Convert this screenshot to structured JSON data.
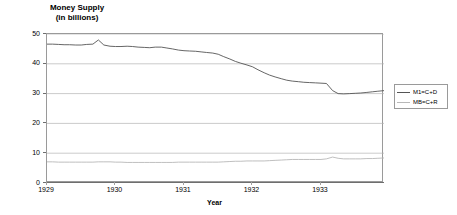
{
  "chart_data": {
    "type": "line",
    "title": "Money Supply",
    "subtitle": "(in billions)",
    "xlabel": "Year",
    "ylabel": "",
    "xlim": [
      1929.0,
      1933.92
    ],
    "ylim": [
      0,
      50
    ],
    "y_ticks": [
      0,
      10,
      20,
      30,
      40,
      50
    ],
    "x_ticks": [
      1929,
      1930,
      1931,
      1932,
      1933
    ],
    "x_tick_labels": [
      "1929",
      "1930",
      "1931",
      "1932",
      "1933"
    ],
    "grid": "horizontal",
    "legend_position": "right-outside",
    "series": [
      {
        "name": "M1=C+D",
        "color": "#555555",
        "x": [
          1929.0,
          1929.08,
          1929.17,
          1929.25,
          1929.33,
          1929.42,
          1929.5,
          1929.58,
          1929.67,
          1929.75,
          1929.83,
          1929.92,
          1930.0,
          1930.08,
          1930.17,
          1930.25,
          1930.33,
          1930.42,
          1930.5,
          1930.58,
          1930.67,
          1930.75,
          1930.83,
          1930.92,
          1931.0,
          1931.08,
          1931.17,
          1931.25,
          1931.33,
          1931.42,
          1931.5,
          1931.58,
          1931.67,
          1931.75,
          1931.83,
          1931.92,
          1932.0,
          1932.08,
          1932.17,
          1932.25,
          1932.33,
          1932.42,
          1932.5,
          1932.58,
          1932.67,
          1932.75,
          1932.83,
          1932.92,
          1933.0,
          1933.08,
          1933.17,
          1933.25,
          1933.33,
          1933.42,
          1933.5,
          1933.58,
          1933.67,
          1933.75,
          1933.83,
          1933.92
        ],
        "values": [
          46.6,
          46.6,
          46.5,
          46.4,
          46.4,
          46.3,
          46.3,
          46.5,
          46.6,
          48.0,
          46.3,
          45.9,
          45.8,
          45.8,
          45.9,
          45.8,
          45.6,
          45.5,
          45.4,
          45.6,
          45.6,
          45.3,
          45.0,
          44.6,
          44.4,
          44.3,
          44.2,
          44.0,
          43.8,
          43.6,
          43.2,
          42.4,
          41.6,
          40.8,
          40.2,
          39.6,
          39.0,
          38.0,
          37.0,
          36.2,
          35.6,
          35.0,
          34.5,
          34.2,
          34.0,
          33.8,
          33.7,
          33.6,
          33.5,
          33.4,
          31.0,
          30.0,
          29.9,
          30.0,
          30.1,
          30.2,
          30.4,
          30.6,
          30.8,
          31.0
        ]
      },
      {
        "name": "MB=C+R",
        "color": "#b8b8b8",
        "x": [
          1929.0,
          1929.08,
          1929.17,
          1929.25,
          1929.33,
          1929.42,
          1929.5,
          1929.58,
          1929.67,
          1929.75,
          1929.83,
          1929.92,
          1930.0,
          1930.08,
          1930.17,
          1930.25,
          1930.33,
          1930.42,
          1930.5,
          1930.58,
          1930.67,
          1930.75,
          1930.83,
          1930.92,
          1931.0,
          1931.08,
          1931.17,
          1931.25,
          1931.33,
          1931.42,
          1931.5,
          1931.58,
          1931.67,
          1931.75,
          1931.83,
          1931.92,
          1932.0,
          1932.08,
          1932.17,
          1932.25,
          1932.33,
          1932.42,
          1932.5,
          1932.58,
          1932.67,
          1932.75,
          1932.83,
          1932.92,
          1933.0,
          1933.08,
          1933.17,
          1933.25,
          1933.33,
          1933.42,
          1933.5,
          1933.58,
          1933.67,
          1933.75,
          1933.83,
          1933.92
        ],
        "values": [
          7.1,
          7.1,
          7.0,
          7.0,
          7.0,
          7.0,
          7.0,
          7.0,
          7.0,
          7.1,
          7.1,
          7.1,
          7.0,
          7.0,
          6.9,
          6.9,
          6.9,
          6.9,
          6.9,
          6.9,
          6.9,
          6.9,
          6.9,
          7.0,
          7.0,
          7.0,
          7.0,
          7.0,
          7.0,
          7.0,
          7.0,
          7.1,
          7.2,
          7.3,
          7.3,
          7.4,
          7.4,
          7.4,
          7.4,
          7.5,
          7.6,
          7.7,
          7.8,
          7.9,
          7.9,
          7.9,
          7.9,
          7.9,
          7.9,
          8.1,
          8.7,
          8.3,
          8.1,
          8.1,
          8.1,
          8.1,
          8.2,
          8.2,
          8.3,
          8.4
        ]
      }
    ]
  },
  "legend": {
    "items": [
      {
        "label": "M1=C+D"
      },
      {
        "label": "MB=C+R"
      }
    ]
  }
}
